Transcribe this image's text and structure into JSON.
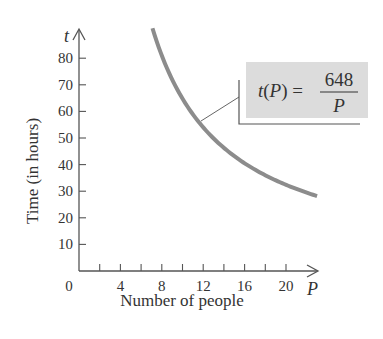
{
  "chart_data": {
    "type": "line",
    "title": "",
    "xlabel": "Number of people",
    "ylabel": "Time (in hours)",
    "x_axis_var": "P",
    "y_axis_var": "t",
    "xlim": [
      0,
      23
    ],
    "ylim": [
      0,
      92
    ],
    "x_ticks": [
      2,
      4,
      6,
      8,
      10,
      12,
      14,
      16,
      18,
      20
    ],
    "x_tick_labels": [
      "0",
      "4",
      "8",
      "12",
      "16",
      "20"
    ],
    "y_ticks": [
      10,
      20,
      30,
      40,
      50,
      60,
      70,
      80
    ],
    "y_tick_labels": [
      "10",
      "20",
      "30",
      "40",
      "50",
      "60",
      "70",
      "80"
    ],
    "grid": false,
    "series": [
      {
        "name": "t(P) = 648/P",
        "function": "648/P",
        "x": [
          7.1,
          8,
          9,
          10,
          11,
          12,
          13,
          14,
          15,
          16,
          17,
          18,
          19,
          20,
          21,
          22,
          23
        ],
        "y": [
          91.3,
          81,
          72,
          64.8,
          58.9,
          54,
          49.8,
          46.3,
          43.2,
          40.5,
          38.1,
          36,
          34.1,
          32.4,
          30.9,
          29.5,
          28.2
        ]
      }
    ],
    "annotation": {
      "lhs": "t(P) =",
      "numerator": "648",
      "denominator": "P"
    },
    "colors": {
      "curve": "#8c8c8c",
      "axis": "#555555",
      "annotation_fill": "#dcdcdc",
      "annotation_border": "#555555"
    }
  }
}
